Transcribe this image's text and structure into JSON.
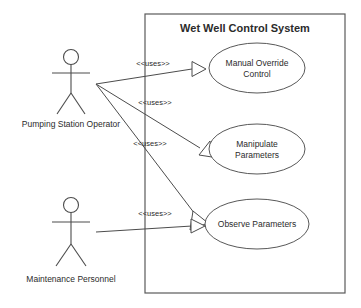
{
  "diagram": {
    "kind": "uml-use-case-diagram",
    "background_color": "#ffffff",
    "line_color": "#4c4c4c",
    "text_color": "#2b2b2b"
  },
  "boundary": {
    "title": "Wet Well Control System",
    "x": 145,
    "y": 14,
    "width": 200,
    "height": 279
  },
  "actors": [
    {
      "id": "pumping-station-operator",
      "label": "Pumping Station Operator",
      "head_cx": 71,
      "head_cy": 57,
      "head_r": 7.5,
      "label_x": 71,
      "label_y": 127
    },
    {
      "id": "maintenance-personnel",
      "label": "Maintenance Personnel",
      "head_cx": 71,
      "head_cy": 205,
      "head_r": 7.5,
      "label_x": 71,
      "label_y": 282
    }
  ],
  "use_cases": [
    {
      "id": "manual-override-control",
      "lines": [
        "Manual Override",
        "Control"
      ],
      "cx": 257,
      "cy": 68,
      "rx": 48,
      "ry": 25
    },
    {
      "id": "manipulate-parameters",
      "lines": [
        "Manipulate",
        "Parameters"
      ],
      "cx": 257,
      "cy": 149,
      "rx": 48,
      "ry": 25
    },
    {
      "id": "observe-parameters",
      "lines": [
        "Observe Parameters"
      ],
      "cx": 257,
      "cy": 224,
      "rx": 52,
      "ry": 25
    }
  ],
  "associations": [
    {
      "id": "operator-to-manual-override",
      "stereotype": "<<uses>>",
      "label_x": 153,
      "label_y": 66,
      "from_x": 96,
      "from_y": 84,
      "to_x": 206,
      "to_y": 69
    },
    {
      "id": "operator-to-observe-parameters",
      "stereotype": "<<uses>>",
      "label_x": 155,
      "label_y": 105,
      "from_x": 96,
      "from_y": 84,
      "to_x": 202,
      "to_y": 221
    },
    {
      "id": "operator-to-manipulate-parameters",
      "stereotype": "<<uses>>",
      "label_x": 150,
      "label_y": 146,
      "from_x": 96,
      "from_y": 84,
      "to_x": 205,
      "to_y": 146
    },
    {
      "id": "maintenance-to-observe-parameters",
      "stereotype": "<<uses>>",
      "label_x": 155,
      "label_y": 216,
      "from_x": 96,
      "from_y": 232,
      "to_x": 203,
      "to_y": 226
    }
  ]
}
